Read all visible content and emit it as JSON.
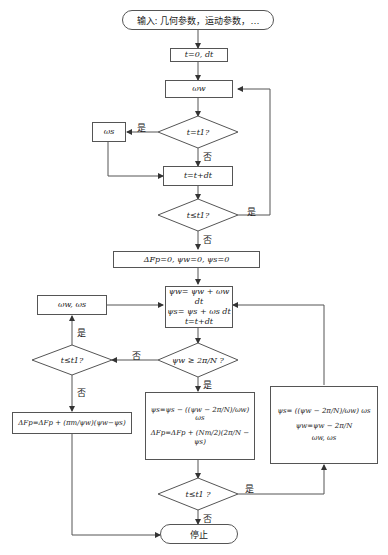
{
  "start": {
    "label": "输入: 几何参数，运动参数，…"
  },
  "init_time": {
    "label": "t=0, dt"
  },
  "omega_w": {
    "label": "ωw"
  },
  "decision_t_eq_t1": {
    "label": "t=t1?"
  },
  "omega_s": {
    "label": "ωs"
  },
  "step_time": {
    "label": "t=t+dt"
  },
  "decision_t_le_t1_a": {
    "label": "t≤t1?"
  },
  "init_forces": {
    "label": "ΔFp=0, ψw=0, ψs=0"
  },
  "integrate": {
    "lines": [
      "ψw= ψw + ωw dt",
      "ψs= ψs + ωs dt",
      "t=t+dt"
    ]
  },
  "decision_psi": {
    "label": "ψw ≥ 2π/N ?"
  },
  "update_left_box": {
    "label": "ωw, ωs"
  },
  "decision_t_le_t1_b": {
    "label": "t≤t1?"
  },
  "force_update_left": {
    "label": "ΔFp=ΔFp + (πm/ψw)(ψw−ψs)"
  },
  "center_update": {
    "lines": [
      "ψs=ψs − ((ψw − 2π/N)/ωw) ωs",
      "ΔFp=ΔFp + (Nm/2)(2π/N − ψs)"
    ]
  },
  "right_update": {
    "lines": [
      "ψs= ((ψw − 2π/N)/ωw) ωs",
      "ψw=ψw − 2π/N",
      "ωw, ωs"
    ]
  },
  "decision_t_le_t1_c": {
    "label": "t≤t1 ?"
  },
  "stop": {
    "label": "停止"
  },
  "edge_labels": {
    "yes": "是",
    "no": "否"
  }
}
